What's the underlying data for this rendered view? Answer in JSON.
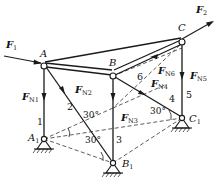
{
  "diagram": {
    "nodes": {
      "A": "A",
      "B": "B",
      "C": "C",
      "A1": {
        "base": "A",
        "sub": "1"
      },
      "B1": {
        "base": "B",
        "sub": "1"
      },
      "C1": {
        "base": "C",
        "sub": "1"
      }
    },
    "external_forces": [
      {
        "id": "F1",
        "base": "F",
        "sub": "1"
      },
      {
        "id": "F2",
        "base": "F",
        "sub": "2"
      }
    ],
    "member_forces": [
      {
        "id": "FN1",
        "base": "F",
        "sub": "N1"
      },
      {
        "id": "FN2",
        "base": "F",
        "sub": "N2"
      },
      {
        "id": "FN3",
        "base": "F",
        "sub": "N3"
      },
      {
        "id": "FN4",
        "base": "F",
        "sub": "N4"
      },
      {
        "id": "FN5",
        "base": "F",
        "sub": "N5"
      },
      {
        "id": "FN6",
        "base": "F",
        "sub": "N6"
      }
    ],
    "member_numbers": [
      "1",
      "2",
      "3",
      "4",
      "5",
      "6"
    ],
    "angles": [
      "30°",
      "30°",
      "30°",
      "30°"
    ]
  }
}
